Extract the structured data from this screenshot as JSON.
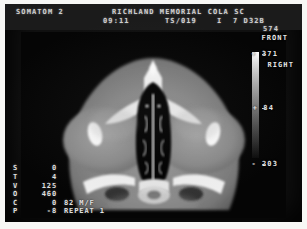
{
  "header": {
    "scanner": "SOMATOM 2",
    "facility": "RICHLAND MEMORIAL COLA SC",
    "time": "09:11",
    "series": "TS/019",
    "slice_code": "I  7 D32B",
    "image_number": "574"
  },
  "patient": {
    "id": "18012"
  },
  "orientation": {
    "front": "FRONT",
    "right": "RIGHT"
  },
  "window_scale": {
    "upper": "+ 371",
    "center": "+ 84",
    "lower": "- 203"
  },
  "parameters": [
    {
      "key": "S",
      "value": "0",
      "extra": ""
    },
    {
      "key": "T",
      "value": "4",
      "extra": ""
    },
    {
      "key": "V",
      "value": "125",
      "extra": ""
    },
    {
      "key": "O",
      "value": "460",
      "extra": ""
    },
    {
      "key": "C",
      "value": "0",
      "extra": "82 M/F"
    },
    {
      "key": "P",
      "value": "-8",
      "extra": "REPEAT 1"
    }
  ],
  "colors": {
    "screen_background": "#121212",
    "text": "#e2e2e2",
    "bone": "#f2f2f2",
    "soft_tissue": "#8e8e8e",
    "air": "#000000"
  }
}
